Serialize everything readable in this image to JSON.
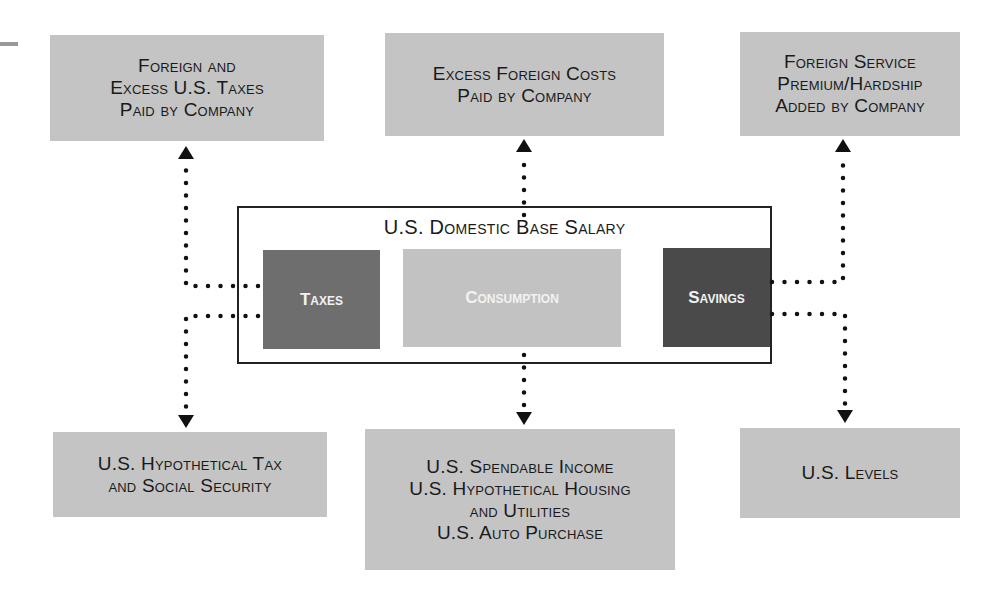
{
  "diagram": {
    "top_boxes": [
      {
        "id": "foreign-taxes",
        "lines": [
          "Foreign and",
          "Excess U.S. Taxes",
          "Paid by Company"
        ]
      },
      {
        "id": "excess-foreign-costs",
        "lines": [
          "Excess Foreign Costs",
          "Paid by Company"
        ]
      },
      {
        "id": "foreign-service-premium",
        "lines": [
          "Foreign Service",
          "Premium/Hardship",
          "Added by Company"
        ]
      }
    ],
    "center": {
      "title": "U.S. Domestic Base Salary",
      "components": [
        {
          "id": "taxes",
          "label": "Taxes",
          "color": "#6e6e6e"
        },
        {
          "id": "consumption",
          "label": "Consumption",
          "color": "#c2c2c2"
        },
        {
          "id": "savings",
          "label": "Savings",
          "color": "#4a4a4a"
        }
      ]
    },
    "bottom_boxes": [
      {
        "id": "hypothetical-tax",
        "lines": [
          "U.S. Hypothetical Tax",
          "and Social Security"
        ]
      },
      {
        "id": "spendable-income",
        "lines": [
          "U.S. Spendable Income",
          "U.S. Hypothetical Housing",
          "and Utilities",
          "U.S. Auto Purchase"
        ]
      },
      {
        "id": "us-levels",
        "lines": [
          "U.S. Levels"
        ]
      }
    ],
    "colors": {
      "box_fill": "#c4c4c4",
      "connector": "#111111"
    }
  }
}
